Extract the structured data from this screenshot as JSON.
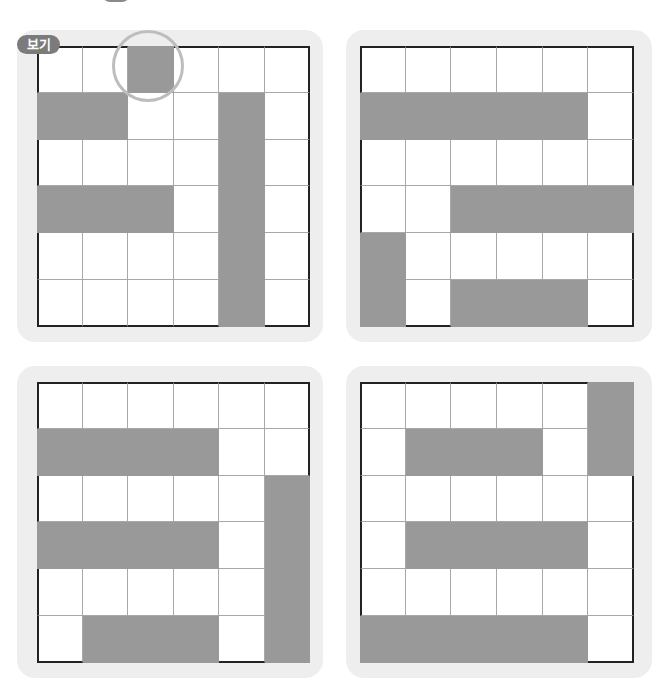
{
  "header": {
    "badge_label": "",
    "instruction_text": ""
  },
  "example_badge": "보기",
  "colors": {
    "filled": "#999999",
    "empty": "#ffffff",
    "panel_bg": "#eeeeee",
    "outer_border": "#222222",
    "grid_line": "#a8a8a8",
    "highlight_circle": "#bdbdbd",
    "badge_bg": "#7b7b7b"
  },
  "panels": [
    {
      "id": "top-left",
      "is_example": true,
      "highlight_cell": [
        0,
        2
      ],
      "rows": 6,
      "cols": 6,
      "filled": [
        [
          0,
          0,
          1,
          0,
          0,
          0
        ],
        [
          1,
          1,
          0,
          0,
          1,
          0
        ],
        [
          0,
          0,
          0,
          0,
          1,
          0
        ],
        [
          1,
          1,
          1,
          0,
          1,
          0
        ],
        [
          0,
          0,
          0,
          0,
          1,
          0
        ],
        [
          0,
          0,
          0,
          0,
          1,
          0
        ]
      ]
    },
    {
      "id": "top-right",
      "is_example": false,
      "rows": 6,
      "cols": 6,
      "filled": [
        [
          0,
          0,
          0,
          0,
          0,
          0
        ],
        [
          1,
          1,
          1,
          1,
          1,
          0
        ],
        [
          0,
          0,
          0,
          0,
          0,
          0
        ],
        [
          0,
          0,
          1,
          1,
          1,
          1
        ],
        [
          1,
          0,
          0,
          0,
          0,
          0
        ],
        [
          1,
          0,
          1,
          1,
          1,
          0
        ]
      ]
    },
    {
      "id": "bottom-left",
      "is_example": false,
      "rows": 6,
      "cols": 6,
      "filled": [
        [
          0,
          0,
          0,
          0,
          0,
          0
        ],
        [
          1,
          1,
          1,
          1,
          0,
          0
        ],
        [
          0,
          0,
          0,
          0,
          0,
          1
        ],
        [
          1,
          1,
          1,
          1,
          0,
          1
        ],
        [
          0,
          0,
          0,
          0,
          0,
          1
        ],
        [
          0,
          1,
          1,
          1,
          0,
          1
        ]
      ]
    },
    {
      "id": "bottom-right",
      "is_example": false,
      "rows": 6,
      "cols": 6,
      "filled": [
        [
          0,
          0,
          0,
          0,
          0,
          1
        ],
        [
          0,
          1,
          1,
          1,
          0,
          1
        ],
        [
          0,
          0,
          0,
          0,
          0,
          0
        ],
        [
          0,
          1,
          1,
          1,
          1,
          0
        ],
        [
          0,
          0,
          0,
          0,
          0,
          0
        ],
        [
          1,
          1,
          1,
          1,
          1,
          0
        ]
      ]
    }
  ]
}
